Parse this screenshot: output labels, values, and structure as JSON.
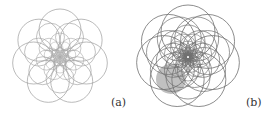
{
  "figure": {
    "panels": [
      {
        "id": "a",
        "label": "(a)",
        "description": "7-fold rosette of overlapping circles, light gray strokes, dense center",
        "center": [
          60,
          57
        ],
        "symmetry": 7,
        "stroke_color": "#a8a8a8",
        "rings": [
          {
            "count": 7,
            "distance": 27,
            "radius": 21,
            "phase": -90,
            "width": 0.8
          },
          {
            "count": 7,
            "distance": 22,
            "radius": 14,
            "phase": -64.3,
            "width": 0.7
          },
          {
            "count": 7,
            "distance": 14,
            "radius": 10,
            "phase": -90,
            "width": 0.6
          },
          {
            "count": 7,
            "distance": 9,
            "radius": 7,
            "phase": -64.3,
            "width": 0.5
          },
          {
            "count": 7,
            "distance": 5,
            "radius": 4.5,
            "phase": -90,
            "width": 0.5
          },
          {
            "count": 7,
            "distance": 3,
            "radius": 2.5,
            "phase": -64.3,
            "width": 0.4
          }
        ],
        "shaded_disks": []
      },
      {
        "id": "b",
        "label": "(b)",
        "description": "Denser rosette of overlapping circles with dark core and a shaded gray disk lower-left",
        "center": [
          52,
          57
        ],
        "symmetry": 7,
        "stroke_color": "#707070",
        "rings": [
          {
            "count": 7,
            "distance": 25,
            "radius": 27,
            "phase": -90,
            "width": 0.8
          },
          {
            "count": 7,
            "distance": 20,
            "radius": 22,
            "phase": -64.3,
            "width": 0.7
          },
          {
            "count": 7,
            "distance": 15,
            "radius": 17,
            "phase": -90,
            "width": 0.7
          },
          {
            "count": 7,
            "distance": 11,
            "radius": 13,
            "phase": -64.3,
            "width": 0.6
          },
          {
            "count": 7,
            "distance": 7,
            "radius": 9,
            "phase": -90,
            "width": 0.6
          },
          {
            "count": 7,
            "distance": 4,
            "radius": 6,
            "phase": -64.3,
            "width": 0.5
          },
          {
            "count": 7,
            "distance": 2,
            "radius": 3.5,
            "phase": -90,
            "width": 0.5
          }
        ],
        "shaded_disks": [
          {
            "cx": 35,
            "cy": 79,
            "r": 15,
            "fill": "#8c8c8c",
            "opacity": 0.55
          }
        ]
      }
    ]
  }
}
